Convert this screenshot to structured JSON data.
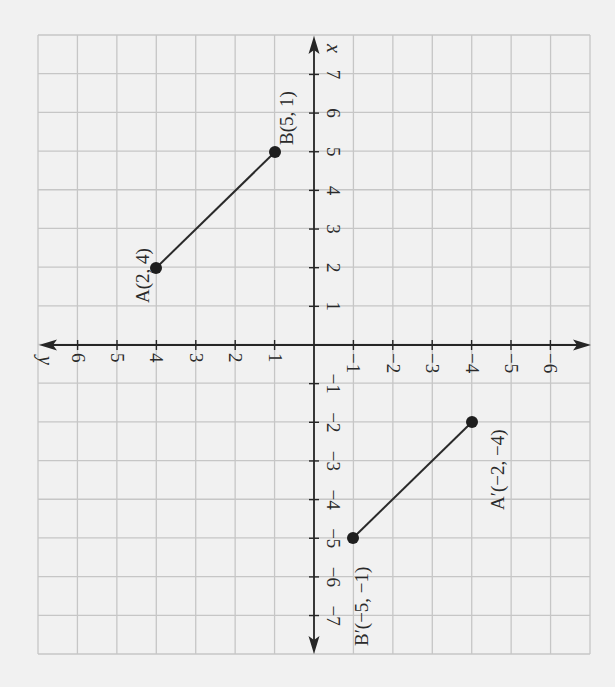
{
  "figure": {
    "background_color": "#f1f1f1",
    "grid_color": "#c6c6c6",
    "ink_color": "#262626",
    "axes": {
      "x_label": "x",
      "y_label": "y",
      "x_ticks": [
        {
          "value": -7,
          "label": "−7"
        },
        {
          "value": -6,
          "label": "−6"
        },
        {
          "value": -5,
          "label": "−5"
        },
        {
          "value": -4,
          "label": "−4"
        },
        {
          "value": -3,
          "label": "−3"
        },
        {
          "value": -2,
          "label": "−2"
        },
        {
          "value": -1,
          "label": "−1"
        },
        {
          "value": 1,
          "label": "1"
        },
        {
          "value": 2,
          "label": "2"
        },
        {
          "value": 3,
          "label": "3"
        },
        {
          "value": 4,
          "label": "4"
        },
        {
          "value": 5,
          "label": "5"
        },
        {
          "value": 6,
          "label": "6"
        },
        {
          "value": 7,
          "label": "7"
        }
      ],
      "y_ticks": [
        {
          "value": -6,
          "label": "−6"
        },
        {
          "value": -5,
          "label": "−5"
        },
        {
          "value": -4,
          "label": "−4"
        },
        {
          "value": -3,
          "label": "−3"
        },
        {
          "value": -2,
          "label": "−2"
        },
        {
          "value": -1,
          "label": "−1"
        },
        {
          "value": 1,
          "label": "1"
        },
        {
          "value": 2,
          "label": "2"
        },
        {
          "value": 3,
          "label": "3"
        },
        {
          "value": 4,
          "label": "4"
        },
        {
          "value": 5,
          "label": "5"
        },
        {
          "value": 6,
          "label": "6"
        }
      ]
    },
    "points": [
      {
        "name": "A",
        "x": 2,
        "y": 4,
        "label": "A(2, 4)"
      },
      {
        "name": "B",
        "x": 5,
        "y": 1,
        "label": "B(5, 1)"
      },
      {
        "name": "A'",
        "x": -2,
        "y": -4,
        "label": "A′(−2, −4)"
      },
      {
        "name": "B'",
        "x": -5,
        "y": -1,
        "label": "B′(−5, −1)"
      }
    ],
    "segments": [
      {
        "from": "A",
        "to": "B",
        "label": "AB"
      },
      {
        "from": "A'",
        "to": "B'",
        "label": "A'B'"
      }
    ]
  },
  "chart_data": {
    "type": "scatter",
    "title": "",
    "xlabel": "x",
    "ylabel": "y",
    "xlim": [
      -8,
      8
    ],
    "ylim": [
      -7,
      7
    ],
    "grid": true,
    "orientation": "rotated 90 degrees counterclockwise on page",
    "series": [
      {
        "name": "AB",
        "x": [
          2,
          5
        ],
        "y": [
          4,
          1
        ],
        "labels": [
          "A(2, 4)",
          "B(5, 1)"
        ]
      },
      {
        "name": "A'B'",
        "x": [
          -2,
          -5
        ],
        "y": [
          -4,
          -1
        ],
        "labels": [
          "A′(−2, −4)",
          "B′(−5, −1)"
        ]
      }
    ]
  }
}
